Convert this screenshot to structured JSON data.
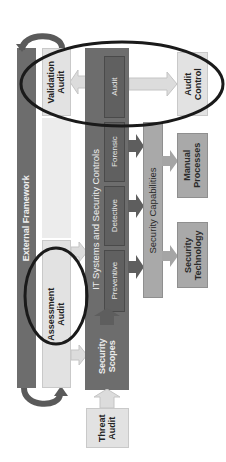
{
  "diagram": {
    "external_framework": {
      "label": "External Framework"
    },
    "validation_audit": {
      "label_line1": "Validation",
      "label_line2": "Audit"
    },
    "assessment_audit": {
      "label_line1": "Assessment",
      "label_line2": "Audit"
    },
    "it_systems": {
      "label": "IT Systems and Security Controls",
      "controls": [
        {
          "label": "Preventive"
        },
        {
          "label": "Detective"
        },
        {
          "label": "Forensic"
        },
        {
          "label": "Audit"
        }
      ]
    },
    "security_capabilities": {
      "label": "Security Capabilities"
    },
    "audit_control": {
      "label_line1": "Audit",
      "label_line2": "Control"
    },
    "manual_processes": {
      "label_line1": "Manual",
      "label_line2": "Processes"
    },
    "security_technology": {
      "label_line1": "Security",
      "label_line2": "Technology"
    },
    "security_scopes": {
      "label_line1": "Security",
      "label_line2": "Scopes"
    },
    "threat_audit": {
      "label_line1": "Threat",
      "label_line2": "Audit"
    },
    "colors": {
      "dark": "#6d6d6d",
      "mid": "#a9a9a9",
      "light": "#e2e2e2",
      "highlight_ellipse": "#1a1a1a"
    },
    "orientation": "rotated-90-ccw"
  }
}
